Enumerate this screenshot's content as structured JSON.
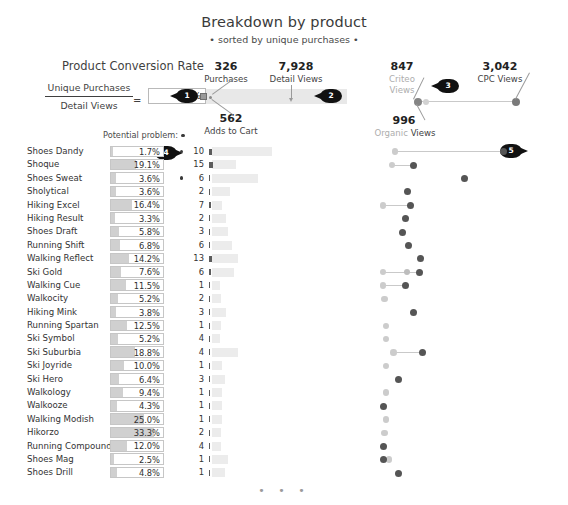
{
  "header": {
    "title": "Breakdown by product",
    "subtitle": "• sorted by unique purchases •"
  },
  "explainer": {
    "title": "Product Conversion Rate",
    "numerator": "Unique Purchases",
    "denominator": "Detail Views",
    "equals": "=",
    "value": "6.2%",
    "potential_problem_label": "Potential problem:"
  },
  "funnel": {
    "purchases_value": "326",
    "purchases_label": "Purchases",
    "detail_views_value": "7,928",
    "detail_views_label": "Detail Views",
    "adds_to_cart_value": "562",
    "adds_to_cart_label": "Adds to Cart"
  },
  "channels": {
    "criteo_value": "847",
    "criteo_label_1": "Criteo",
    "criteo_label_2": "Views",
    "cpc_value": "3,042",
    "cpc_label": "CPC Views",
    "organic_value": "996",
    "organic_label_light": "Organic",
    "organic_label_dark": "Views"
  },
  "callouts": [
    {
      "id": "1",
      "number": "1"
    },
    {
      "id": "2",
      "number": "2"
    },
    {
      "id": "3",
      "number": "3"
    },
    {
      "id": "4",
      "number": "4"
    },
    {
      "id": "5",
      "number": "5"
    }
  ],
  "colors": {
    "bar_fill": "#d0d0d0",
    "detail_bar": "#ececec",
    "dot_light": "#cccccc",
    "dot_dark": "#555555",
    "badge": "#111111",
    "funnel_band": "#e8e8e8"
  },
  "footer": {
    "ellipsis": "• • •"
  },
  "chart_data": {
    "type": "table",
    "title": "Breakdown by product",
    "subtitle": "• sorted by unique purchases •",
    "columns": [
      "Product",
      "Product Conversion Rate",
      "Potential problem",
      "Unique Purchases",
      "Adds to Cart",
      "Detail Views",
      "Organic Views",
      "Criteo Views",
      "CPC Views"
    ],
    "rows": [
      {
        "name": "Shoes Dandy",
        "pct": "1.7%",
        "pct_value": 1.7,
        "problem": true,
        "purchases": "10",
        "cart": 10,
        "detail": 60,
        "organic": 10,
        "criteo": null,
        "cpc": 82
      },
      {
        "name": "Shoque",
        "pct": "19.1%",
        "pct_value": 19.1,
        "problem": false,
        "purchases": "15",
        "cart": 14,
        "detail": 24,
        "organic": 8,
        "criteo": null,
        "cpc": 22
      },
      {
        "name": "Shoes Sweat",
        "pct": "3.6%",
        "pct_value": 3.6,
        "problem": true,
        "purchases": "6",
        "cart": 5,
        "detail": 46,
        "organic": null,
        "criteo": null,
        "cpc": 56
      },
      {
        "name": "Sholytical",
        "pct": "3.6%",
        "pct_value": 3.6,
        "problem": false,
        "purchases": "2",
        "cart": 2,
        "detail": 18,
        "organic": null,
        "criteo": null,
        "cpc": 18
      },
      {
        "name": "Hiking Excel",
        "pct": "16.4%",
        "pct_value": 16.4,
        "problem": false,
        "purchases": "7",
        "cart": 6,
        "detail": 10,
        "organic": 2,
        "criteo": null,
        "cpc": 20
      },
      {
        "name": "Hiking Result",
        "pct": "3.3%",
        "pct_value": 3.3,
        "problem": false,
        "purchases": "2",
        "cart": 2,
        "detail": 14,
        "organic": null,
        "criteo": null,
        "cpc": 17
      },
      {
        "name": "Shoes Draft",
        "pct": "5.8%",
        "pct_value": 5.8,
        "problem": false,
        "purchases": "3",
        "cart": 3,
        "detail": 16,
        "organic": null,
        "criteo": null,
        "cpc": 15
      },
      {
        "name": "Running Shift",
        "pct": "6.8%",
        "pct_value": 6.8,
        "problem": false,
        "purchases": "6",
        "cart": 5,
        "detail": 20,
        "organic": null,
        "criteo": null,
        "cpc": 19
      },
      {
        "name": "Walking Reflect",
        "pct": "14.2%",
        "pct_value": 14.2,
        "problem": false,
        "purchases": "13",
        "cart": 12,
        "detail": 26,
        "organic": null,
        "criteo": null,
        "cpc": 27
      },
      {
        "name": "Ski Gold",
        "pct": "7.6%",
        "pct_value": 7.6,
        "problem": false,
        "purchases": "6",
        "cart": 6,
        "detail": 22,
        "organic": 2,
        "criteo": 18,
        "cpc": 26
      },
      {
        "name": "Walking Cue",
        "pct": "11.5%",
        "pct_value": 11.5,
        "problem": false,
        "purchases": "1",
        "cart": 1,
        "detail": 8,
        "organic": 2,
        "criteo": null,
        "cpc": 17
      },
      {
        "name": "Walkocity",
        "pct": "5.2%",
        "pct_value": 5.2,
        "problem": false,
        "purchases": "2",
        "cart": 2,
        "detail": 9,
        "organic": 3,
        "criteo": null,
        "cpc": null
      },
      {
        "name": "Hiking Mink",
        "pct": "3.8%",
        "pct_value": 3.8,
        "problem": false,
        "purchases": "3",
        "cart": 3,
        "detail": 14,
        "organic": null,
        "criteo": null,
        "cpc": 22
      },
      {
        "name": "Running Spartan",
        "pct": "12.5%",
        "pct_value": 12.5,
        "problem": false,
        "purchases": "1",
        "cart": 1,
        "detail": 9,
        "organic": 4,
        "criteo": null,
        "cpc": null
      },
      {
        "name": "Ski Symbol",
        "pct": "5.2%",
        "pct_value": 5.2,
        "problem": false,
        "purchases": "4",
        "cart": 4,
        "detail": 8,
        "organic": 4,
        "criteo": null,
        "cpc": null
      },
      {
        "name": "Ski Suburbia",
        "pct": "18.8%",
        "pct_value": 18.8,
        "problem": false,
        "purchases": "4",
        "cart": 4,
        "detail": 26,
        "organic": 9,
        "criteo": null,
        "cpc": 28
      },
      {
        "name": "Ski Joyride",
        "pct": "10.0%",
        "pct_value": 10.0,
        "problem": false,
        "purchases": "1",
        "cart": 1,
        "detail": 10,
        "organic": 4,
        "criteo": null,
        "cpc": null
      },
      {
        "name": "Ski Hero",
        "pct": "6.4%",
        "pct_value": 6.4,
        "problem": false,
        "purchases": "3",
        "cart": 3,
        "detail": 13,
        "organic": null,
        "criteo": null,
        "cpc": 12
      },
      {
        "name": "Walkology",
        "pct": "9.4%",
        "pct_value": 9.4,
        "problem": false,
        "purchases": "1",
        "cart": 1,
        "detail": 10,
        "organic": 4,
        "criteo": null,
        "cpc": null
      },
      {
        "name": "Walkooze",
        "pct": "4.3%",
        "pct_value": 4.3,
        "problem": false,
        "purchases": "1",
        "cart": 1,
        "detail": 10,
        "organic": null,
        "criteo": null,
        "cpc": 2
      },
      {
        "name": "Walking Modish",
        "pct": "25.0%",
        "pct_value": 25.0,
        "problem": false,
        "purchases": "1",
        "cart": 1,
        "detail": 10,
        "organic": 4,
        "criteo": null,
        "cpc": null
      },
      {
        "name": "Hikorzo",
        "pct": "33.3%",
        "pct_value": 33.3,
        "problem": false,
        "purchases": "2",
        "cart": 2,
        "detail": 9,
        "organic": 3,
        "criteo": null,
        "cpc": null
      },
      {
        "name": "Running Compound",
        "pct": "12.0%",
        "pct_value": 12.0,
        "problem": false,
        "purchases": "4",
        "cart": 4,
        "detail": 9,
        "organic": null,
        "criteo": null,
        "cpc": 2
      },
      {
        "name": "Shoes Mag",
        "pct": "2.5%",
        "pct_value": 2.5,
        "problem": false,
        "purchases": "1",
        "cart": 1,
        "detail": 16,
        "organic": 6,
        "criteo": null,
        "cpc": 2
      },
      {
        "name": "Shoes Drill",
        "pct": "4.8%",
        "pct_value": 4.8,
        "problem": false,
        "purchases": "1",
        "cart": 1,
        "detail": 13,
        "organic": null,
        "criteo": null,
        "cpc": 12
      }
    ],
    "pct_axis_max": 40,
    "scatter_axis_max": 100
  }
}
